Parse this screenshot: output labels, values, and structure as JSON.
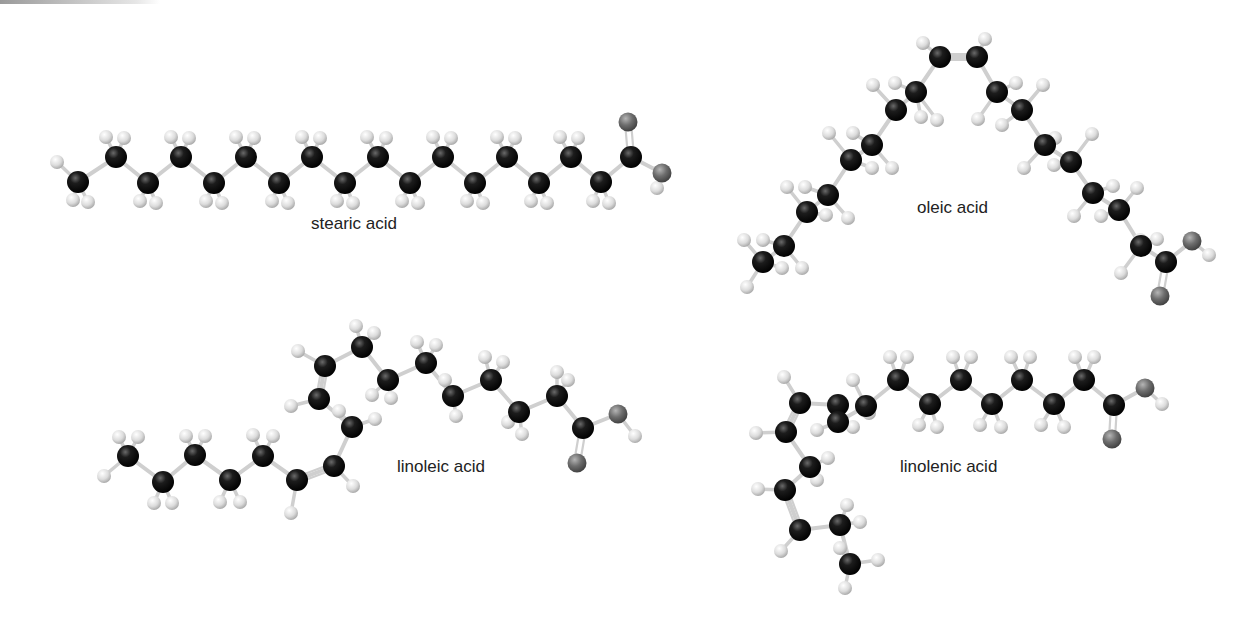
{
  "figure": {
    "colors": {
      "carbon": "#111111",
      "hydrogen": "#d9d9d9",
      "oxygen": "#6e6e6e",
      "bond": "#cfcfcf",
      "label": "#222222"
    },
    "molecules": [
      {
        "id": "stearic",
        "name": "stearic acid",
        "label_pos": [
          311,
          230
        ],
        "carbons": [
          [
            78,
            182
          ],
          [
            116,
            157
          ],
          [
            148,
            183
          ],
          [
            181,
            157
          ],
          [
            214,
            183
          ],
          [
            246,
            157
          ],
          [
            279,
            183
          ],
          [
            312,
            157
          ],
          [
            345,
            183
          ],
          [
            378,
            157
          ],
          [
            410,
            183
          ],
          [
            443,
            157
          ],
          [
            475,
            183
          ],
          [
            507,
            157
          ],
          [
            539,
            183
          ],
          [
            571,
            157
          ],
          [
            601,
            182
          ],
          [
            631,
            157
          ]
        ],
        "double_bonds": [
          [
            [
              631,
              157
            ],
            [
              628,
              122
            ]
          ]
        ],
        "oxygens": [
          [
            628,
            122
          ],
          [
            662,
            173
          ]
        ],
        "hydrogens": [
          [
            57,
            162
          ],
          [
            73,
            200
          ],
          [
            88,
            202
          ],
          [
            106,
            137
          ],
          [
            124,
            138
          ],
          [
            140,
            201
          ],
          [
            156,
            203
          ],
          [
            171,
            137
          ],
          [
            189,
            138
          ],
          [
            206,
            201
          ],
          [
            222,
            203
          ],
          [
            236,
            137
          ],
          [
            254,
            138
          ],
          [
            272,
            201
          ],
          [
            288,
            203
          ],
          [
            302,
            137
          ],
          [
            320,
            138
          ],
          [
            337,
            201
          ],
          [
            353,
            203
          ],
          [
            367,
            137
          ],
          [
            386,
            138
          ],
          [
            402,
            201
          ],
          [
            418,
            203
          ],
          [
            433,
            137
          ],
          [
            451,
            138
          ],
          [
            467,
            201
          ],
          [
            483,
            203
          ],
          [
            497,
            137
          ],
          [
            515,
            138
          ],
          [
            531,
            201
          ],
          [
            547,
            203
          ],
          [
            560,
            137
          ],
          [
            578,
            138
          ],
          [
            593,
            201
          ],
          [
            609,
            203
          ],
          [
            657,
            188
          ]
        ]
      },
      {
        "id": "oleic",
        "name": "oleic acid",
        "label_pos": [
          917,
          214
        ],
        "carbons": [
          [
            763,
            262
          ],
          [
            784,
            246
          ],
          [
            807,
            212
          ],
          [
            828,
            195
          ],
          [
            851,
            160
          ],
          [
            872,
            145
          ],
          [
            896,
            110
          ],
          [
            916,
            92
          ],
          [
            940,
            57
          ],
          [
            977,
            57
          ],
          [
            997,
            92
          ],
          [
            1022,
            110
          ],
          [
            1045,
            145
          ],
          [
            1071,
            162
          ],
          [
            1093,
            193
          ],
          [
            1119,
            210
          ],
          [
            1141,
            246
          ],
          [
            1166,
            262
          ]
        ],
        "double_bonds": [
          [
            [
              940,
              57
            ],
            [
              977,
              57
            ]
          ],
          [
            [
              1166,
              262
            ],
            [
              1160,
              296
            ]
          ]
        ],
        "oxygens": [
          [
            1160,
            296
          ],
          [
            1192,
            241
          ]
        ],
        "hydrogens": [
          [
            744,
            240
          ],
          [
            763,
            240
          ],
          [
            747,
            287
          ],
          [
            782,
            268
          ],
          [
            802,
            268
          ],
          [
            787,
            187
          ],
          [
            805,
            187
          ],
          [
            826,
            215
          ],
          [
            848,
            218
          ],
          [
            829,
            133
          ],
          [
            853,
            133
          ],
          [
            872,
            168
          ],
          [
            892,
            168
          ],
          [
            873,
            85
          ],
          [
            895,
            83
          ],
          [
            921,
            117
          ],
          [
            937,
            120
          ],
          [
            923,
            43
          ],
          [
            985,
            39
          ],
          [
            978,
            119
          ],
          [
            1002,
            125
          ],
          [
            1016,
            83
          ],
          [
            1043,
            85
          ],
          [
            1024,
            168
          ],
          [
            1054,
            165
          ],
          [
            1055,
            138
          ],
          [
            1092,
            134
          ],
          [
            1074,
            216
          ],
          [
            1101,
            216
          ],
          [
            1113,
            186
          ],
          [
            1137,
            188
          ],
          [
            1121,
            273
          ],
          [
            1140,
            240
          ],
          [
            1157,
            239
          ],
          [
            1209,
            255
          ]
        ]
      },
      {
        "id": "linoleic",
        "name": "linoleic acid",
        "label_pos": [
          397,
          473
        ],
        "carbons": [
          [
            128,
            456
          ],
          [
            163,
            482
          ],
          [
            195,
            455
          ],
          [
            230,
            480
          ],
          [
            263,
            456
          ],
          [
            297,
            480
          ],
          [
            334,
            466
          ],
          [
            352,
            427
          ],
          [
            319,
            399
          ],
          [
            325,
            366
          ],
          [
            362,
            347
          ],
          [
            388,
            380
          ],
          [
            426,
            363
          ],
          [
            453,
            396
          ],
          [
            491,
            380
          ],
          [
            519,
            412
          ],
          [
            557,
            396
          ],
          [
            583,
            428
          ]
        ],
        "double_bonds": [
          [
            [
              297,
              480
            ],
            [
              334,
              466
            ]
          ],
          [
            [
              319,
              399
            ],
            [
              325,
              366
            ]
          ],
          [
            [
              583,
              428
            ],
            [
              577,
              463
            ]
          ]
        ],
        "oxygens": [
          [
            577,
            463
          ],
          [
            618,
            414
          ]
        ],
        "hydrogens": [
          [
            119,
            437
          ],
          [
            138,
            437
          ],
          [
            104,
            476
          ],
          [
            154,
            503
          ],
          [
            172,
            503
          ],
          [
            186,
            436
          ],
          [
            205,
            436
          ],
          [
            220,
            502
          ],
          [
            240,
            502
          ],
          [
            253,
            435
          ],
          [
            273,
            436
          ],
          [
            291,
            513
          ],
          [
            353,
            486
          ],
          [
            339,
            411
          ],
          [
            375,
            419
          ],
          [
            291,
            406
          ],
          [
            298,
            351
          ],
          [
            356,
            326
          ],
          [
            374,
            333
          ],
          [
            372,
            395
          ],
          [
            391,
            398
          ],
          [
            417,
            342
          ],
          [
            436,
            345
          ],
          [
            445,
            380
          ],
          [
            456,
            416
          ],
          [
            485,
            357
          ],
          [
            503,
            362
          ],
          [
            508,
            422
          ],
          [
            522,
            434
          ],
          [
            557,
            372
          ],
          [
            568,
            380
          ],
          [
            635,
            436
          ]
        ]
      },
      {
        "id": "linolenic",
        "name": "linolenic acid",
        "label_pos": [
          900,
          473
        ],
        "carbons": [
          [
            850,
            564
          ],
          [
            840,
            525
          ],
          [
            800,
            530
          ],
          [
            785,
            490
          ],
          [
            810,
            467
          ],
          [
            786,
            432
          ],
          [
            800,
            403
          ],
          [
            838,
            405
          ],
          [
            838,
            422
          ],
          [
            866,
            406
          ],
          [
            898,
            380
          ],
          [
            930,
            404
          ],
          [
            961,
            380
          ],
          [
            992,
            404
          ],
          [
            1022,
            380
          ],
          [
            1054,
            404
          ],
          [
            1084,
            380
          ],
          [
            1114,
            405
          ]
        ],
        "double_bonds": [
          [
            [
              800,
              530
            ],
            [
              785,
              490
            ]
          ],
          [
            [
              786,
              432
            ],
            [
              800,
              403
            ]
          ],
          [
            [
              1114,
              405
            ],
            [
              1112,
              439
            ]
          ]
        ],
        "oxygens": [
          [
            1112,
            439
          ],
          [
            1145,
            388
          ]
        ],
        "hydrogens": [
          [
            845,
            588
          ],
          [
            878,
            560
          ],
          [
            840,
            548
          ],
          [
            847,
            505
          ],
          [
            860,
            522
          ],
          [
            781,
            551
          ],
          [
            758,
            489
          ],
          [
            828,
            458
          ],
          [
            817,
            480
          ],
          [
            756,
            433
          ],
          [
            784,
            377
          ],
          [
            853,
            380
          ],
          [
            817,
            430
          ],
          [
            853,
            427
          ],
          [
            869,
            413
          ],
          [
            890,
            357
          ],
          [
            907,
            357
          ],
          [
            919,
            425
          ],
          [
            937,
            427
          ],
          [
            953,
            357
          ],
          [
            971,
            357
          ],
          [
            980,
            425
          ],
          [
            1001,
            427
          ],
          [
            1011,
            357
          ],
          [
            1030,
            357
          ],
          [
            1041,
            425
          ],
          [
            1064,
            427
          ],
          [
            1075,
            357
          ],
          [
            1094,
            357
          ],
          [
            1162,
            404
          ]
        ]
      }
    ]
  }
}
